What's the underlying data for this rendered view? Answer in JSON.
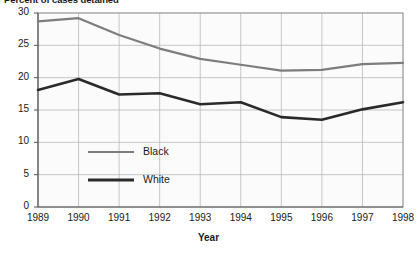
{
  "chart_data": {
    "type": "line",
    "title": "Percent of cases detained",
    "xlabel": "Year",
    "ylabel": "",
    "categories": [
      1989,
      1990,
      1991,
      1992,
      1993,
      1994,
      1995,
      1996,
      1997,
      1998
    ],
    "x_tick_labels": [
      "1989",
      "1990",
      "1991",
      "1992",
      "1993",
      "1994",
      "1995",
      "1996",
      "1997",
      "1998"
    ],
    "y_tick_labels": [
      "0",
      "5",
      "10",
      "15",
      "20",
      "25",
      "30"
    ],
    "y_ticks": [
      0,
      5,
      10,
      15,
      20,
      25,
      30
    ],
    "ylim": [
      0,
      30
    ],
    "xlim": [
      1989,
      1998
    ],
    "grid": true,
    "legend_position": "inside-lower-left",
    "series": [
      {
        "name": "Black",
        "color": "#7d7d7d",
        "values": [
          28.7,
          29.2,
          26.6,
          24.5,
          22.9,
          22.0,
          21.1,
          21.2,
          22.1,
          22.3
        ]
      },
      {
        "name": "White",
        "color": "#2a2a2a",
        "values": [
          18.1,
          19.8,
          17.4,
          17.6,
          15.9,
          16.2,
          13.9,
          13.5,
          15.1,
          16.2
        ]
      }
    ]
  },
  "legend": {
    "items": [
      {
        "label": "Black",
        "color": "#7d7d7d"
      },
      {
        "label": "White",
        "color": "#2a2a2a"
      }
    ]
  },
  "colors": {
    "black_series": "#7d7d7d",
    "white_series": "#2a2a2a",
    "grid": "#b9b9b9",
    "axis": "#555555",
    "plot_background": "#fbfbfb",
    "text": "#1a1a1a"
  }
}
